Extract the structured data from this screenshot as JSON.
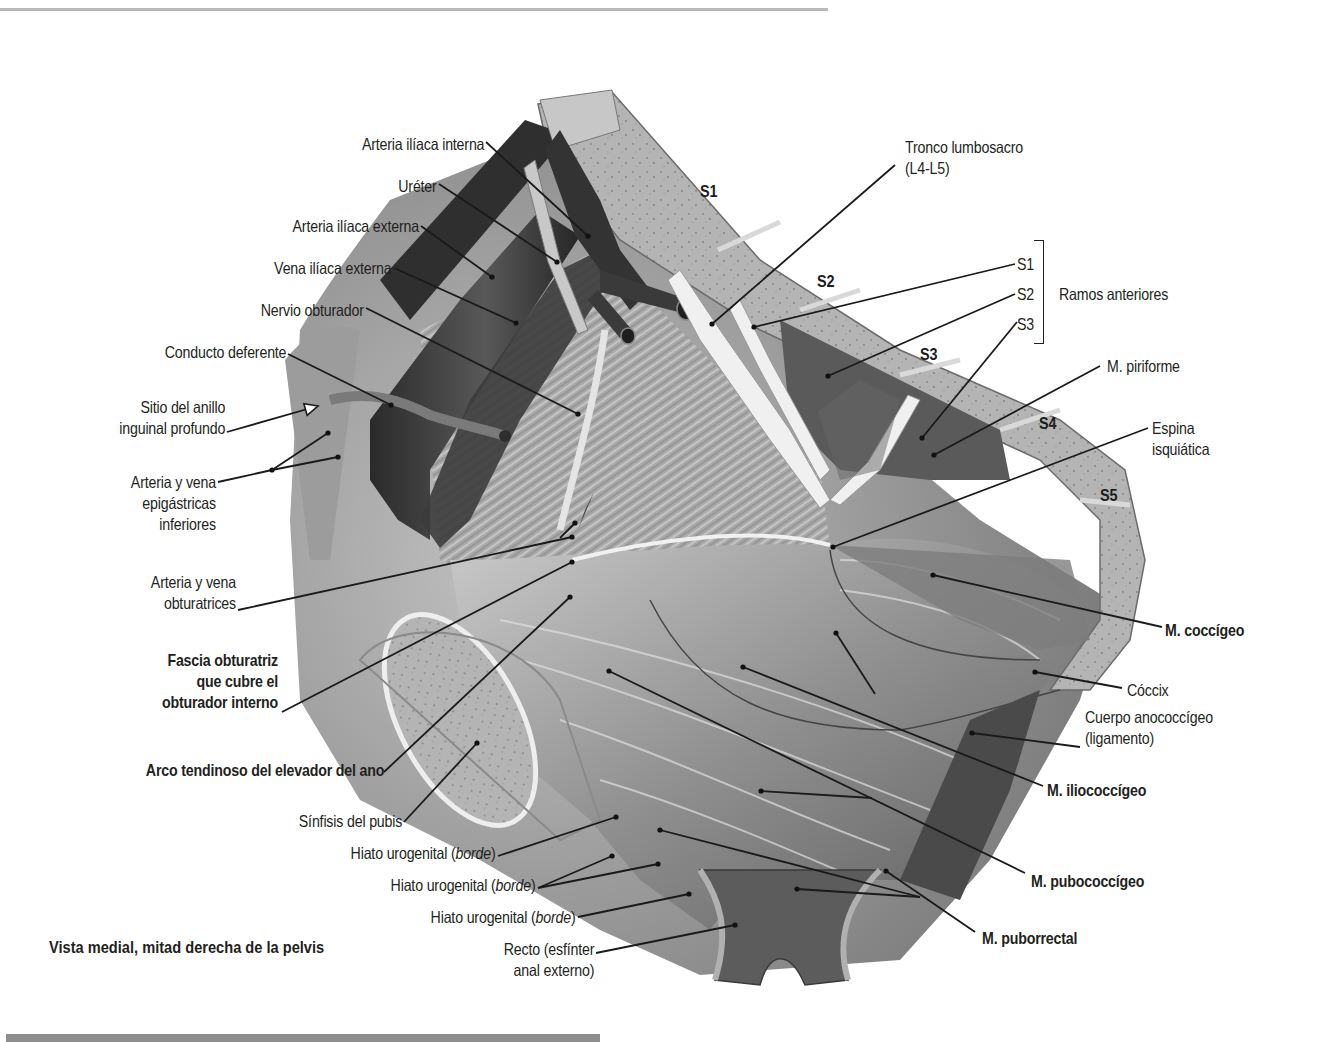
{
  "figure": {
    "caption": "Vista medial, mitad derecha de la pelvis",
    "bone_labels": [
      {
        "text": "S1",
        "x": 700,
        "y": 193
      },
      {
        "text": "S2",
        "x": 817,
        "y": 283
      },
      {
        "text": "S3",
        "x": 920,
        "y": 356
      },
      {
        "text": "S4",
        "x": 1039,
        "y": 425
      },
      {
        "text": "S5",
        "x": 1100,
        "y": 497
      }
    ],
    "bracket_label": "Ramos anteriores",
    "labels_left": [
      {
        "id": "arteria-iliaca-interna",
        "lines": [
          "Arteria ilíaca interna"
        ],
        "right": 484,
        "top": 134,
        "bold": false,
        "line": [
          [
            486,
            142
          ],
          [
            588,
            236
          ]
        ]
      },
      {
        "id": "ureter",
        "lines": [
          "Uréter"
        ],
        "right": 437,
        "top": 176,
        "bold": false,
        "line": [
          [
            439,
            184
          ],
          [
            557,
            262
          ]
        ]
      },
      {
        "id": "arteria-iliaca-externa",
        "lines": [
          "Arteria ilíaca externa"
        ],
        "right": 419,
        "top": 216,
        "bold": false,
        "line": [
          [
            421,
            226
          ],
          [
            492,
            277
          ]
        ]
      },
      {
        "id": "vena-iliaca-externa",
        "lines": [
          "Vena ilíaca externa"
        ],
        "right": 392,
        "top": 258,
        "bold": false,
        "line": [
          [
            394,
            268
          ],
          [
            516,
            323
          ]
        ]
      },
      {
        "id": "nervio-obturador",
        "lines": [
          "Nervio obturador"
        ],
        "right": 364,
        "top": 300,
        "bold": false,
        "line": [
          [
            366,
            308
          ],
          [
            578,
            414
          ]
        ]
      },
      {
        "id": "conducto-deferente",
        "lines": [
          "Conducto deferente"
        ],
        "right": 286,
        "top": 342,
        "bold": false,
        "line": [
          [
            288,
            354
          ],
          [
            391,
            405
          ]
        ]
      },
      {
        "id": "sitio-anillo-inguinal",
        "lines": [
          "Sitio del anillo",
          "inguinal profundo"
        ],
        "right": 225,
        "top": 397,
        "bold": false,
        "line": [
          [
            227,
            432
          ],
          [
            318,
            406
          ]
        ],
        "arrow": true
      },
      {
        "id": "arteria-vena-epigastricas",
        "lines": [
          "Arteria y vena",
          "epigástricas",
          "inferiores"
        ],
        "right": 216,
        "top": 472,
        "bold": false,
        "line": [
          [
            218,
            482
          ],
          [
            272,
            470
          ]
        ],
        "branches": [
          [
            [
              272,
              470
            ],
            [
              328,
              433
            ]
          ],
          [
            [
              272,
              470
            ],
            [
              338,
              457
            ]
          ]
        ]
      },
      {
        "id": "arteria-vena-obturatrices",
        "lines": [
          "Arteria y vena",
          "obturatrices"
        ],
        "right": 236,
        "top": 572,
        "bold": false,
        "line": [
          [
            238,
            610
          ],
          [
            572,
            537
          ]
        ],
        "branches": [
          [
            [
              560,
              538
            ],
            [
              575,
              523
            ]
          ]
        ]
      },
      {
        "id": "fascia-obturatriz",
        "lines": [
          "Fascia obturatriz",
          "que cubre el",
          "obturador interno"
        ],
        "right": 278,
        "top": 650,
        "bold": true,
        "line": [
          [
            282,
            712
          ],
          [
            572,
            562
          ]
        ]
      },
      {
        "id": "arco-tendinoso",
        "lines": [
          "Arco tendinoso del elevador del ano"
        ],
        "right": 384,
        "top": 760,
        "bold": true,
        "line": [
          [
            384,
            772
          ],
          [
            570,
            597
          ]
        ]
      },
      {
        "id": "sinfisis-pubis",
        "lines": [
          "Sínfisis del pubis"
        ],
        "right": 402,
        "top": 811,
        "bold": false,
        "line": [
          [
            404,
            822
          ],
          [
            477,
            743
          ]
        ]
      },
      {
        "id": "hiato-urogenital-1",
        "lines": [
          "Hiato urogenital (borde)"
        ],
        "right": 496,
        "top": 843,
        "bold": false,
        "italic": "borde",
        "line": [
          [
            498,
            856
          ],
          [
            616,
            817
          ]
        ]
      },
      {
        "id": "hiato-urogenital-2",
        "lines": [
          "Hiato urogenital (borde)"
        ],
        "right": 536,
        "top": 875,
        "bold": false,
        "italic": "borde",
        "line": [
          [
            538,
            888
          ],
          [
            612,
            856
          ]
        ],
        "branches": [
          [
            [
              538,
              888
            ],
            [
              658,
              864
            ]
          ]
        ]
      },
      {
        "id": "hiato-urogenital-3",
        "lines": [
          "Hiato urogenital (borde)"
        ],
        "right": 576,
        "top": 907,
        "bold": false,
        "italic": "borde",
        "line": [
          [
            578,
            917
          ],
          [
            689,
            894
          ]
        ]
      },
      {
        "id": "recto",
        "lines": [
          "Recto (esfínter",
          "anal externo)"
        ],
        "right": 594,
        "top": 939,
        "bold": false,
        "line": [
          [
            596,
            953
          ],
          [
            735,
            925
          ]
        ]
      }
    ],
    "labels_right": [
      {
        "id": "tronco-lumbosacro",
        "lines": [
          "Tronco lumbosacro",
          "(L4-L5)"
        ],
        "left": 905,
        "top": 137,
        "bold": false,
        "line": [
          [
            895,
            165
          ],
          [
            712,
            324
          ]
        ]
      },
      {
        "id": "ramo-s1",
        "lines": [
          "S1"
        ],
        "left": 1017,
        "top": 254,
        "bold": false,
        "line": [
          [
            1015,
            264
          ],
          [
            754,
            327
          ]
        ]
      },
      {
        "id": "ramo-s2",
        "lines": [
          "S2"
        ],
        "left": 1017,
        "top": 284,
        "bold": false,
        "line": [
          [
            1015,
            294
          ],
          [
            828,
            376
          ]
        ]
      },
      {
        "id": "ramo-s3",
        "lines": [
          "S3"
        ],
        "left": 1017,
        "top": 314,
        "bold": false,
        "line": [
          [
            1017,
            322
          ],
          [
            922,
            438
          ]
        ]
      },
      {
        "id": "m-piriforme",
        "lines": [
          "M. piriforme"
        ],
        "left": 1107,
        "top": 356,
        "bold": false,
        "line": [
          [
            1100,
            366
          ],
          [
            934,
            455
          ]
        ]
      },
      {
        "id": "espina-isquiatica",
        "lines": [
          "Espina",
          "isquiática"
        ],
        "left": 1152,
        "top": 418,
        "bold": false,
        "line": [
          [
            1148,
            428
          ],
          [
            833,
            547
          ]
        ]
      },
      {
        "id": "m-coccigeo",
        "lines": [
          "M. coccígeo"
        ],
        "left": 1165,
        "top": 620,
        "bold": true,
        "line": [
          [
            1162,
            627
          ],
          [
            933,
            575
          ]
        ]
      },
      {
        "id": "coccix",
        "lines": [
          "Cóccix"
        ],
        "left": 1127,
        "top": 680,
        "bold": false,
        "line": [
          [
            1122,
            688
          ],
          [
            1035,
            672
          ]
        ]
      },
      {
        "id": "cuerpo-anococcigeo",
        "lines": [
          "Cuerpo anococcígeo",
          "(ligamento)"
        ],
        "left": 1085,
        "top": 707,
        "bold": false,
        "line": [
          [
            1080,
            747
          ],
          [
            972,
            733
          ]
        ]
      },
      {
        "id": "m-iliococcigeo",
        "lines": [
          "M. iliococcígeo"
        ],
        "left": 1047,
        "top": 780,
        "bold": true,
        "line": [
          [
            1043,
            786
          ],
          [
            743,
            667
          ]
        ],
        "branches": [
          [
            [
              875,
              694
            ],
            [
              836,
              633
            ]
          ]
        ]
      },
      {
        "id": "m-pubococcigeo",
        "lines": [
          "M. pubococcígeo"
        ],
        "left": 1031,
        "top": 871,
        "bold": true,
        "line": [
          [
            1025,
            873
          ],
          [
            609,
            671
          ]
        ],
        "branches": [
          [
            [
              872,
              798
            ],
            [
              761,
              791
            ]
          ]
        ]
      },
      {
        "id": "m-puborrectal",
        "lines": [
          "M. puborrectal"
        ],
        "left": 982,
        "top": 928,
        "bold": true,
        "line": [
          [
            975,
            932
          ],
          [
            886,
            871
          ]
        ],
        "branches": [
          [
            [
              920,
              897
            ],
            [
              660,
              830
            ]
          ],
          [
            [
              920,
              897
            ],
            [
              797,
              889
            ]
          ]
        ]
      }
    ]
  }
}
